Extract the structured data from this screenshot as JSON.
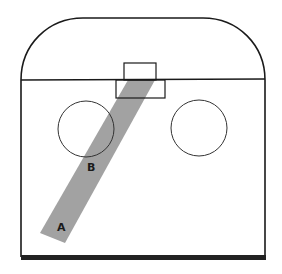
{
  "diagram": {
    "type": "hockey-rink-zone",
    "colors": {
      "background": "#ffffff",
      "line": "#1a1a1a",
      "band": "#a2a2a2",
      "bottom_border": "#222222"
    },
    "rink": {
      "left_x": 21,
      "right_x": 265,
      "top_y": 18,
      "goal_line_y": 80,
      "bottom_y": 257,
      "corner_radius": 62
    },
    "goal": {
      "net": {
        "x": 124,
        "y": 63,
        "w": 32,
        "h": 17
      },
      "crease": {
        "x": 116,
        "y": 80,
        "w": 49,
        "h": 18
      }
    },
    "faceoff_circles": [
      {
        "name": "left",
        "cx": 86,
        "cy": 129,
        "r": 28
      },
      {
        "name": "right",
        "cx": 199,
        "cy": 128,
        "r": 28
      }
    ],
    "shooting_lane": {
      "points": [
        [
          128,
          80
        ],
        [
          155,
          80
        ],
        [
          65,
          243
        ],
        [
          40,
          233
        ]
      ]
    },
    "labels": [
      {
        "text": "B",
        "x": 91,
        "y": 171
      },
      {
        "text": "A",
        "x": 61,
        "y": 231
      }
    ]
  }
}
